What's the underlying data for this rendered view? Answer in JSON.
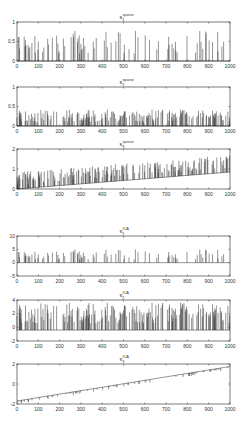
{
  "figure": {
    "width": 248,
    "height": 421,
    "line_color": "#111111",
    "axis_color": "#222222",
    "text_color": "#333333"
  },
  "chart_data": [
    {
      "type": "line",
      "title": "s_1^sparse",
      "title_main": "s",
      "title_sub": "1",
      "title_sup": "sparse",
      "xlim": [
        0,
        1000
      ],
      "ylim": [
        0,
        1
      ],
      "xticks": [
        0,
        100,
        200,
        300,
        400,
        500,
        600,
        700,
        800,
        900,
        1000
      ],
      "yticks": [
        0,
        0.5,
        1
      ],
      "ytick_labels": [
        "0",
        "0.5",
        "1"
      ],
      "pattern": "sparse_spikes",
      "baseline_start": 0,
      "baseline_end": 0,
      "spike_max": 0.78,
      "density": 0.18,
      "seed": 11,
      "box": {
        "x": 17,
        "y": 22,
        "w": 213,
        "h": 39
      }
    },
    {
      "type": "line",
      "title": "s_2^sparse",
      "title_main": "s",
      "title_sub": "2",
      "title_sup": "sparse",
      "xlim": [
        0,
        1000
      ],
      "ylim": [
        0,
        1
      ],
      "xticks": [
        0,
        100,
        200,
        300,
        400,
        500,
        600,
        700,
        800,
        900,
        1000
      ],
      "yticks": [
        0,
        0.5,
        1
      ],
      "ytick_labels": [
        "0",
        "0.5",
        "1"
      ],
      "pattern": "sparse_spikes",
      "baseline_start": 0,
      "baseline_end": 0,
      "spike_max": 0.42,
      "density": 0.35,
      "seed": 23,
      "box": {
        "x": 17,
        "y": 87,
        "w": 213,
        "h": 39
      }
    },
    {
      "type": "line",
      "title": "s_3^sparse",
      "title_main": "s",
      "title_sub": "3",
      "title_sup": "sparse",
      "xlim": [
        0,
        1000
      ],
      "ylim": [
        0,
        2
      ],
      "xticks": [
        0,
        100,
        200,
        300,
        400,
        500,
        600,
        700,
        800,
        900,
        1000
      ],
      "yticks": [
        0,
        1,
        2
      ],
      "ytick_labels": [
        "0",
        "1",
        "2"
      ],
      "pattern": "ramp_spikes",
      "baseline_start": 0.0,
      "baseline_end": 0.85,
      "spike_max": 0.85,
      "density": 0.35,
      "seed": 37,
      "box": {
        "x": 17,
        "y": 149,
        "w": 213,
        "h": 40
      }
    },
    {
      "type": "line",
      "title": "s_1^ICA",
      "title_main": "s",
      "title_sub": "1",
      "title_sup": "ICA",
      "xlim": [
        0,
        1000
      ],
      "ylim": [
        -5,
        10
      ],
      "xticks": [
        0,
        100,
        200,
        300,
        400,
        500,
        600,
        700,
        800,
        900,
        1000
      ],
      "yticks": [
        -5,
        0,
        5,
        10
      ],
      "ytick_labels": [
        "-5",
        "0",
        "5",
        "10"
      ],
      "pattern": "sparse_spikes",
      "baseline_start": 0,
      "baseline_end": 0,
      "spike_max": 5.0,
      "density": 0.18,
      "seed": 11,
      "box": {
        "x": 17,
        "y": 236,
        "w": 213,
        "h": 40
      }
    },
    {
      "type": "line",
      "title": "s_2^ICA",
      "title_main": "s",
      "title_sub": "2",
      "title_sup": "ICA",
      "xlim": [
        0,
        1000
      ],
      "ylim": [
        -2,
        4
      ],
      "xticks": [
        0,
        100,
        200,
        300,
        400,
        500,
        600,
        700,
        800,
        900,
        1000
      ],
      "yticks": [
        -2,
        0,
        2,
        4
      ],
      "ytick_labels": [
        "-2",
        "0",
        "2",
        "4"
      ],
      "pattern": "sparse_spikes",
      "baseline_start": -0.4,
      "baseline_end": -0.4,
      "spike_max": 4.0,
      "density": 0.35,
      "seed": 23,
      "box": {
        "x": 17,
        "y": 300,
        "w": 213,
        "h": 41
      }
    },
    {
      "type": "line",
      "title": "s_3^ICA",
      "title_main": "s",
      "title_sub": "3",
      "title_sup": "ICA",
      "xlim": [
        0,
        1000
      ],
      "ylim": [
        -2,
        2
      ],
      "xticks": [
        0,
        100,
        200,
        300,
        400,
        500,
        600,
        700,
        800,
        900,
        1000
      ],
      "yticks": [
        -2,
        0,
        2
      ],
      "ytick_labels": [
        "-2",
        "0",
        "2"
      ],
      "pattern": "ramp_dips",
      "baseline_start": -1.7,
      "baseline_end": 1.75,
      "spike_max": -0.35,
      "density": 0.12,
      "seed": 37,
      "box": {
        "x": 17,
        "y": 364,
        "w": 213,
        "h": 40
      }
    }
  ]
}
